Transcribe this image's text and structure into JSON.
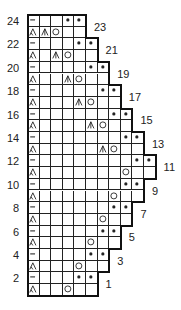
{
  "chart_data": {
    "type": "table",
    "legend_symbols": {
      "-": "purl / WS knit (dash)",
      "L": "left-leaning double decrease (sk2p)",
      "C": "centered double decrease",
      "O": "yarn over",
      "*": "bind off / bobble dot",
      "_": "knit (blank)"
    },
    "rows": [
      {
        "row": 24,
        "label": "24",
        "side": "left",
        "cells": [
          "-",
          "_",
          "_",
          "*",
          "*"
        ]
      },
      {
        "row": 23,
        "label": "23",
        "side": "right",
        "cells": [
          "L",
          "C",
          "O",
          "_",
          "_"
        ]
      },
      {
        "row": 22,
        "label": "22",
        "side": "left",
        "cells": [
          "-",
          "_",
          "_",
          "_",
          "*",
          "*"
        ]
      },
      {
        "row": 21,
        "label": "21",
        "side": "right",
        "cells": [
          "L",
          "_",
          "C",
          "O",
          "_",
          "_"
        ]
      },
      {
        "row": 20,
        "label": "20",
        "side": "left",
        "cells": [
          "-",
          "_",
          "_",
          "_",
          "_",
          "*",
          "*"
        ]
      },
      {
        "row": 19,
        "label": "19",
        "side": "right",
        "cells": [
          "L",
          "_",
          "_",
          "C",
          "O",
          "_",
          "_"
        ]
      },
      {
        "row": 18,
        "label": "18",
        "side": "left",
        "cells": [
          "-",
          "_",
          "_",
          "_",
          "_",
          "_",
          "*",
          "*"
        ]
      },
      {
        "row": 17,
        "label": "17",
        "side": "right",
        "cells": [
          "L",
          "_",
          "_",
          "_",
          "C",
          "O",
          "_",
          "_"
        ]
      },
      {
        "row": 16,
        "label": "16",
        "side": "left",
        "cells": [
          "-",
          "_",
          "_",
          "_",
          "_",
          "_",
          "_",
          "*",
          "*"
        ]
      },
      {
        "row": 15,
        "label": "15",
        "side": "right",
        "cells": [
          "L",
          "_",
          "_",
          "_",
          "_",
          "C",
          "O",
          "_",
          "_"
        ]
      },
      {
        "row": 14,
        "label": "14",
        "side": "left",
        "cells": [
          "-",
          "_",
          "_",
          "_",
          "_",
          "_",
          "_",
          "_",
          "*",
          "*"
        ]
      },
      {
        "row": 13,
        "label": "13",
        "side": "right",
        "cells": [
          "L",
          "_",
          "_",
          "_",
          "_",
          "_",
          "C",
          "O",
          "_",
          "_"
        ]
      },
      {
        "row": 12,
        "label": "12",
        "side": "left",
        "cells": [
          "-",
          "_",
          "_",
          "_",
          "_",
          "_",
          "_",
          "_",
          "_",
          "*",
          "*"
        ]
      },
      {
        "row": 11,
        "label": "11",
        "side": "right",
        "cells": [
          "L",
          "_",
          "_",
          "_",
          "_",
          "_",
          "_",
          "_",
          "O",
          "_",
          "_"
        ]
      },
      {
        "row": 10,
        "label": "10",
        "side": "left",
        "cells": [
          "-",
          "_",
          "_",
          "_",
          "_",
          "_",
          "_",
          "_",
          "*",
          "*"
        ]
      },
      {
        "row": 9,
        "label": "9",
        "side": "right",
        "cells": [
          "L",
          "_",
          "_",
          "_",
          "_",
          "_",
          "_",
          "O",
          "_",
          "_"
        ]
      },
      {
        "row": 8,
        "label": "8",
        "side": "left",
        "cells": [
          "-",
          "_",
          "_",
          "_",
          "_",
          "_",
          "_",
          "*",
          "*"
        ]
      },
      {
        "row": 7,
        "label": "7",
        "side": "right",
        "cells": [
          "L",
          "_",
          "_",
          "_",
          "_",
          "_",
          "O",
          "_",
          "_"
        ]
      },
      {
        "row": 6,
        "label": "6",
        "side": "left",
        "cells": [
          "-",
          "_",
          "_",
          "_",
          "_",
          "_",
          "*",
          "*"
        ]
      },
      {
        "row": 5,
        "label": "5",
        "side": "right",
        "cells": [
          "L",
          "_",
          "_",
          "_",
          "_",
          "O",
          "_",
          "_"
        ]
      },
      {
        "row": 4,
        "label": "4",
        "side": "left",
        "cells": [
          "-",
          "_",
          "_",
          "_",
          "_",
          "*",
          "*"
        ]
      },
      {
        "row": 3,
        "label": "3",
        "side": "right",
        "cells": [
          "L",
          "_",
          "_",
          "_",
          "O",
          "_",
          "_"
        ]
      },
      {
        "row": 2,
        "label": "2",
        "side": "left",
        "cells": [
          "-",
          "_",
          "_",
          "_",
          "*",
          "*"
        ]
      },
      {
        "row": 1,
        "label": "1",
        "side": "right",
        "cells": [
          "L",
          "_",
          "_",
          "O",
          "_",
          "_"
        ]
      }
    ]
  },
  "colors": {
    "ink": "#222222",
    "background": "#ffffff"
  }
}
